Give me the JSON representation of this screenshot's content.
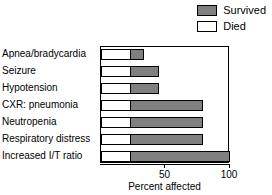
{
  "chart_data": {
    "type": "bar",
    "orientation": "horizontal",
    "stacked": true,
    "title": "",
    "xlabel": "Percent affected",
    "ylabel": "",
    "xlim": [
      0,
      100
    ],
    "xticks": [
      50,
      100
    ],
    "xtick_labels": [
      "50",
      "100"
    ],
    "grid": false,
    "legend_position": "top-right",
    "categories": [
      "Apnea/bradycardia",
      "Seizure",
      "Hypotension",
      "CXR: pneumonia",
      "Neutropenia",
      "Respiratory distress",
      "Increased I/T ratio"
    ],
    "series": [
      {
        "name": "Died",
        "color": "#ffffff",
        "values": [
          23,
          23,
          23,
          23,
          23,
          23,
          23
        ]
      },
      {
        "name": "Survived",
        "color": "#808080",
        "values": [
          33,
          45,
          45,
          79,
          79,
          79,
          100
        ]
      }
    ]
  },
  "legend": {
    "items": [
      {
        "label": "Survived",
        "swatch": "survived-swatch"
      },
      {
        "label": "Died",
        "swatch": "died-swatch"
      }
    ]
  },
  "axis": {
    "x_title": "Percent affected",
    "ticks": [
      {
        "label": "50",
        "value": 50
      },
      {
        "label": "100",
        "value": 100
      }
    ]
  },
  "categories": [
    "Apnea/bradycardia",
    "Seizure",
    "Hypotension",
    "CXR: pneumonia",
    "Neutropenia",
    "Respiratory distress",
    "Increased I/T ratio"
  ]
}
